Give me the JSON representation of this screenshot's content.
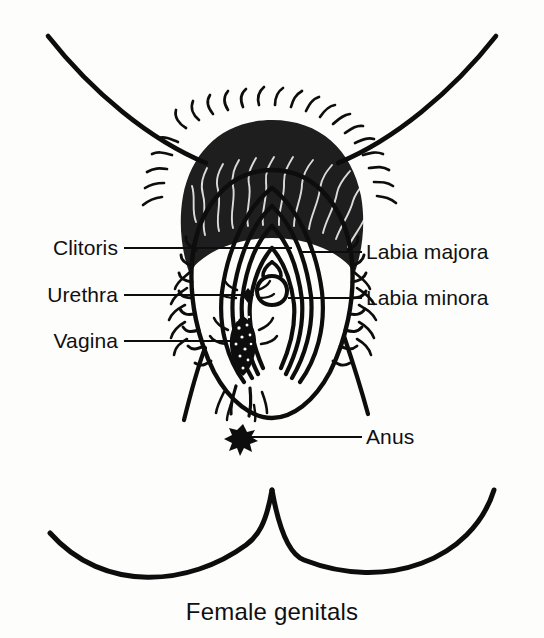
{
  "figure": {
    "caption": "Female genitals",
    "background_color": "#fdfdfc",
    "ink_color": "#0d0d0d",
    "labels_left": [
      {
        "text": "Clitoris",
        "text_x": 118,
        "y": 248,
        "leader_from_x": 124,
        "leader_to_x": 292
      },
      {
        "text": "Urethra",
        "text_x": 118,
        "y": 295,
        "leader_from_x": 124,
        "leader_to_x": 248
      },
      {
        "text": "Vagina",
        "text_x": 118,
        "y": 341,
        "leader_from_x": 124,
        "leader_to_x": 243
      }
    ],
    "labels_right": [
      {
        "text": "Labia majora",
        "text_x": 366,
        "y": 252,
        "leader_from_x": 300,
        "leader_to_x": 362
      },
      {
        "text": "Labia minora",
        "text_x": 366,
        "y": 298,
        "leader_from_x": 288,
        "leader_to_x": 362
      },
      {
        "text": "Anus",
        "text_x": 366,
        "y": 437,
        "leader_from_x": 246,
        "leader_to_x": 362
      }
    ],
    "anus_marker": {
      "cx": 243,
      "cy": 437
    }
  }
}
